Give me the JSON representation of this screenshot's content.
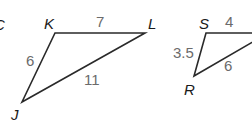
{
  "diagram": {
    "partial_label": "C",
    "triangle_jkl": {
      "vertices": {
        "K": {
          "label": "K",
          "x": 55,
          "y": 33
        },
        "L": {
          "label": "L",
          "x": 145,
          "y": 33
        },
        "J": {
          "label": "J",
          "x": 22,
          "y": 102
        }
      },
      "sides": {
        "KL": {
          "label": "7"
        },
        "JK": {
          "label": "6"
        },
        "JL": {
          "label": "11"
        }
      }
    },
    "triangle_rst": {
      "vertices": {
        "S": {
          "label": "S",
          "x": 206,
          "y": 33
        },
        "R": {
          "label": "R",
          "x": 194,
          "y": 76
        }
      },
      "sides": {
        "ST": {
          "label": "4"
        },
        "RS": {
          "label": "3.5"
        },
        "RT": {
          "label": "6"
        }
      }
    },
    "colors": {
      "line": "#2a2a2a",
      "vertex_label": "#1a1a1a",
      "side_label": "#6b6b6b",
      "background": "#ffffff"
    }
  }
}
